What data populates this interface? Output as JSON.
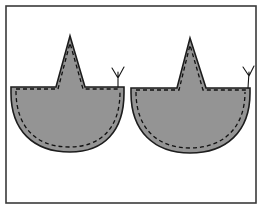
{
  "figure": {
    "canvas": {
      "width": 262,
      "height": 209
    },
    "background_color": "#ffffff",
    "frame": {
      "label": "illustration-border",
      "x": 6,
      "y": 6,
      "width": 250,
      "height": 197,
      "stroke_color": "#3a3a3a",
      "stroke_width": 1.6,
      "fill": "none"
    },
    "style": {
      "fabric_fill": "#949494",
      "outline_color": "#1d1d1d",
      "outline_width": 1.6,
      "stitch_color": "#101010",
      "stitch_width": 1.3,
      "stitch_dash": "4 3",
      "thread_color": "#151515",
      "thread_width": 1.1
    },
    "pieces": [
      {
        "name": "left-fabric-piece",
        "label": "Left piece",
        "outline_path": "M 11 87 L 56 87 L 70 36 L 85 87 L 124 87 L 124 93 C 124 131 104 152 70 152 C 33 152 11 130 11 93 Z",
        "stitch_path": "M 16 89 L 58 89 L 70 43 L 83 89 L 120 89 M 16 91 C 16 127 36 147 69 147 C 101 147 120 128 120 92",
        "stitch_label": "running-stitch-line",
        "thread": {
          "name": "thread-tail-left",
          "path": "M 118 87 L 118 72 M 118 78 L 112 68 M 118 78 L 124 67",
          "label": "Thread tail"
        }
      },
      {
        "name": "right-fabric-piece",
        "label": "Right piece",
        "outline_path": "M 131 88 L 177 88 L 190 38 L 206 88 L 250 88 L 250 93 C 250 132 226 153 190 153 C 154 153 131 131 131 93 Z",
        "stitch_path": "M 136 90 L 179 90 L 190 45 L 203 90 L 246 90 M 136 92 C 136 128 157 148 190 148 C 223 148 245 128 245 92",
        "stitch_label": "running-stitch-line",
        "thread": {
          "name": "thread-tail-right",
          "path": "M 248 88 L 249 72 M 249 76 L 243 67 M 249 76 L 254 66",
          "label": "Thread tail"
        }
      }
    ]
  }
}
